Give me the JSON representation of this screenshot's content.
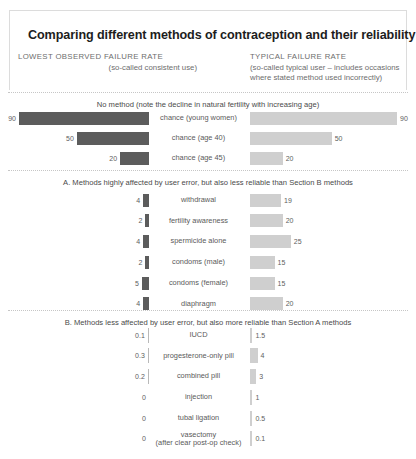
{
  "title": "Comparing different methods of contraception and their reliability",
  "columns": {
    "left": {
      "caption": "LOWEST OBSERVED FAILURE RATE",
      "subtitle": "(so-called consistent use)"
    },
    "right": {
      "caption": "TYPICAL FAILURE RATE",
      "subtitle_line1": "(so-called typical user – includes occasions",
      "subtitle_line2": "where stated method used incorrectly)"
    }
  },
  "colors": {
    "bar_left": "#5c5c5c",
    "bar_right": "#cfcfcf",
    "text": "#5a5a5a",
    "rule": "#c6c6c6"
  },
  "sections": [
    {
      "heading": "No method (note the decline in natural fertility with increasing age)",
      "rows": [
        {
          "label": "chance (young women)",
          "left": "90",
          "right": "90"
        },
        {
          "label": "chance (age 40)",
          "left": "50",
          "right": "50"
        },
        {
          "label": "chance (age 45)",
          "left": "20",
          "right": "20"
        }
      ]
    },
    {
      "heading": "A. Methods highly affected by user error, but also less reliable than Section B methods",
      "rows": [
        {
          "label": "withdrawal",
          "left": "4",
          "right": "19"
        },
        {
          "label": "fertility awareness",
          "left": "2",
          "right": "20"
        },
        {
          "label": "spermicide alone",
          "left": "4",
          "right": "25"
        },
        {
          "label": "condoms (male)",
          "left": "2",
          "right": "15"
        },
        {
          "label": "condoms (female)",
          "left": "5",
          "right": "15"
        },
        {
          "label": "diaphragm",
          "left": "4",
          "right": "20"
        }
      ]
    },
    {
      "heading": "B. Methods less affected by user error, but also more reliable than Section A methods",
      "rows": [
        {
          "label": "IUCD",
          "left": "0.1",
          "right": "1.5"
        },
        {
          "label": "progesterone-only pill",
          "left": "0.3",
          "right": "4"
        },
        {
          "label": "combined pill",
          "left": "0.2",
          "right": "3"
        },
        {
          "label": "injection",
          "left": "0",
          "right": "1"
        },
        {
          "label": "tubal ligation",
          "left": "0",
          "right": "0.5"
        },
        {
          "label": "vasectomy\n(after clear post-op check)",
          "left": "0",
          "right": "0.1"
        }
      ]
    }
  ],
  "chart_data": {
    "type": "bar",
    "title": "Comparing different methods of contraception and their reliability",
    "orientation": "horizontal-bidirectional",
    "xlabel": "",
    "ylabel": "",
    "series": [
      {
        "name": "LOWEST OBSERVED FAILURE RATE (so-called consistent use)",
        "side": "left",
        "color": "#5c5c5c",
        "values": [
          90,
          50,
          20,
          4,
          2,
          4,
          2,
          5,
          4,
          0.1,
          0.3,
          0.2,
          0,
          0,
          0
        ]
      },
      {
        "name": "TYPICAL FAILURE RATE (so-called typical user – includes occasions where stated method used incorrectly)",
        "side": "right",
        "color": "#cfcfcf",
        "values": [
          90,
          50,
          20,
          19,
          20,
          25,
          15,
          15,
          20,
          1.5,
          4,
          3,
          1,
          0.5,
          0.1
        ]
      }
    ],
    "categories": [
      "chance (young women)",
      "chance (age 40)",
      "chance (age 45)",
      "withdrawal",
      "fertility awareness",
      "spermicide alone",
      "condoms (male)",
      "condoms (female)",
      "diaphragm",
      "IUCD",
      "progesterone-only pill",
      "combined pill",
      "injection",
      "tubal ligation",
      "vasectomy (after clear post-op check)"
    ],
    "groups": [
      {
        "name": "No method (note the decline in natural fertility with increasing age)",
        "categories": [
          0,
          1,
          2
        ]
      },
      {
        "name": "A. Methods highly affected by user error, but also less reliable than Section B methods",
        "categories": [
          3,
          4,
          5,
          6,
          7,
          8
        ]
      },
      {
        "name": "B. Methods less affected by user error, but also more reliable than Section A methods",
        "categories": [
          9,
          10,
          11,
          12,
          13,
          14
        ]
      }
    ],
    "units": "failure rate (% of women experiencing unintended pregnancy in first year)",
    "xlim": [
      0,
      90
    ],
    "grid": false,
    "legend": "column-headers"
  }
}
